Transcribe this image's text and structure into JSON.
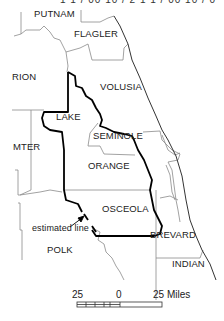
{
  "header": {
    "text": "1 1 / 00 10 / 2   1 1 / 00 10 / 0"
  },
  "counties": [
    {
      "name": "PUTNAM",
      "x": 34,
      "y": 14
    },
    {
      "name": "FLAGLER",
      "x": 74,
      "y": 34
    },
    {
      "name": "RION",
      "x": 12,
      "y": 77
    },
    {
      "name": "VOLUSIA",
      "x": 100,
      "y": 87
    },
    {
      "name": "LAKE",
      "x": 56,
      "y": 117
    },
    {
      "name": "SEMINOLE",
      "x": 93,
      "y": 136
    },
    {
      "name": "MTER",
      "x": 13,
      "y": 147
    },
    {
      "name": "ORANGE",
      "x": 88,
      "y": 166
    },
    {
      "name": "OSCEOLA",
      "x": 102,
      "y": 209
    },
    {
      "name": "BREVARD",
      "x": 150,
      "y": 235
    },
    {
      "name": "POLK",
      "x": 47,
      "y": 250
    },
    {
      "name": "INDIAN",
      "x": 172,
      "y": 264
    }
  ],
  "annotation": {
    "text": "estimated line",
    "x": 32,
    "y": 228
  },
  "scale": {
    "left": "25",
    "middle": "0",
    "right": "25 Miles"
  },
  "colors": {
    "thin_border": "#888888",
    "thick_border": "#000000",
    "coast": "#333333",
    "text": "#222222"
  }
}
